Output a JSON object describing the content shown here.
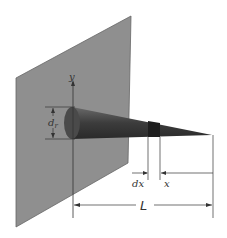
{
  "figure": {
    "labels": {
      "y_axis": "y",
      "base_diameter": "d",
      "base_diameter_sub": "r",
      "element_length": "dx",
      "position": "x",
      "total_length": "L"
    },
    "colors": {
      "wall": "#8f8f8f",
      "wall_edge": "#555555",
      "cone_dark": "#3a3a3a",
      "cone_mid": "#5a5a5a",
      "line": "#333333"
    }
  }
}
